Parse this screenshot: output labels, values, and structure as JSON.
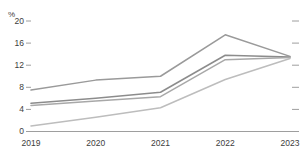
{
  "chart_data": {
    "type": "line",
    "title": "",
    "subtitle": "",
    "xlabel": "",
    "ylabel": "%",
    "unit_label": "%",
    "categories": [
      "2019",
      "2020",
      "2021",
      "2022",
      "2023"
    ],
    "x": [
      2019,
      2020,
      2021,
      2022,
      2023
    ],
    "xlim": [
      2019,
      2023
    ],
    "ylim": [
      0,
      20
    ],
    "yticks": [
      0,
      4,
      8,
      12,
      16,
      20
    ],
    "ytick_labels": [
      "0",
      "4",
      "8",
      "12",
      "16",
      "20"
    ],
    "xtick_labels": [
      "2019",
      "2020",
      "2021",
      "2022",
      "2023"
    ],
    "grid": false,
    "legend": "none",
    "right_axis_ticks": true,
    "series": [
      {
        "name": "series-1",
        "color": "#9a9a9a",
        "values": [
          7.5,
          9.3,
          10.0,
          17.5,
          13.6
        ]
      },
      {
        "name": "series-2",
        "color": "#8c8c8c",
        "values": [
          5.1,
          6.0,
          7.1,
          13.8,
          13.5
        ]
      },
      {
        "name": "series-3",
        "color": "#a8a8a8",
        "values": [
          4.7,
          5.5,
          6.3,
          13.0,
          13.4
        ]
      },
      {
        "name": "series-4",
        "color": "#bdbdbd",
        "values": [
          1.0,
          2.6,
          4.3,
          9.4,
          13.2
        ]
      }
    ]
  },
  "axis": {
    "unit": "%",
    "y_labels": [
      "20",
      "16",
      "12",
      "8",
      "4",
      "0"
    ],
    "x_labels": [
      "2019",
      "2020",
      "2021",
      "2022",
      "2023"
    ]
  },
  "colors": {
    "axis_line": "#9e9e9e",
    "tick_mark": "#9e9e9e",
    "text": "#3d3d3d",
    "background": "#ffffff"
  }
}
